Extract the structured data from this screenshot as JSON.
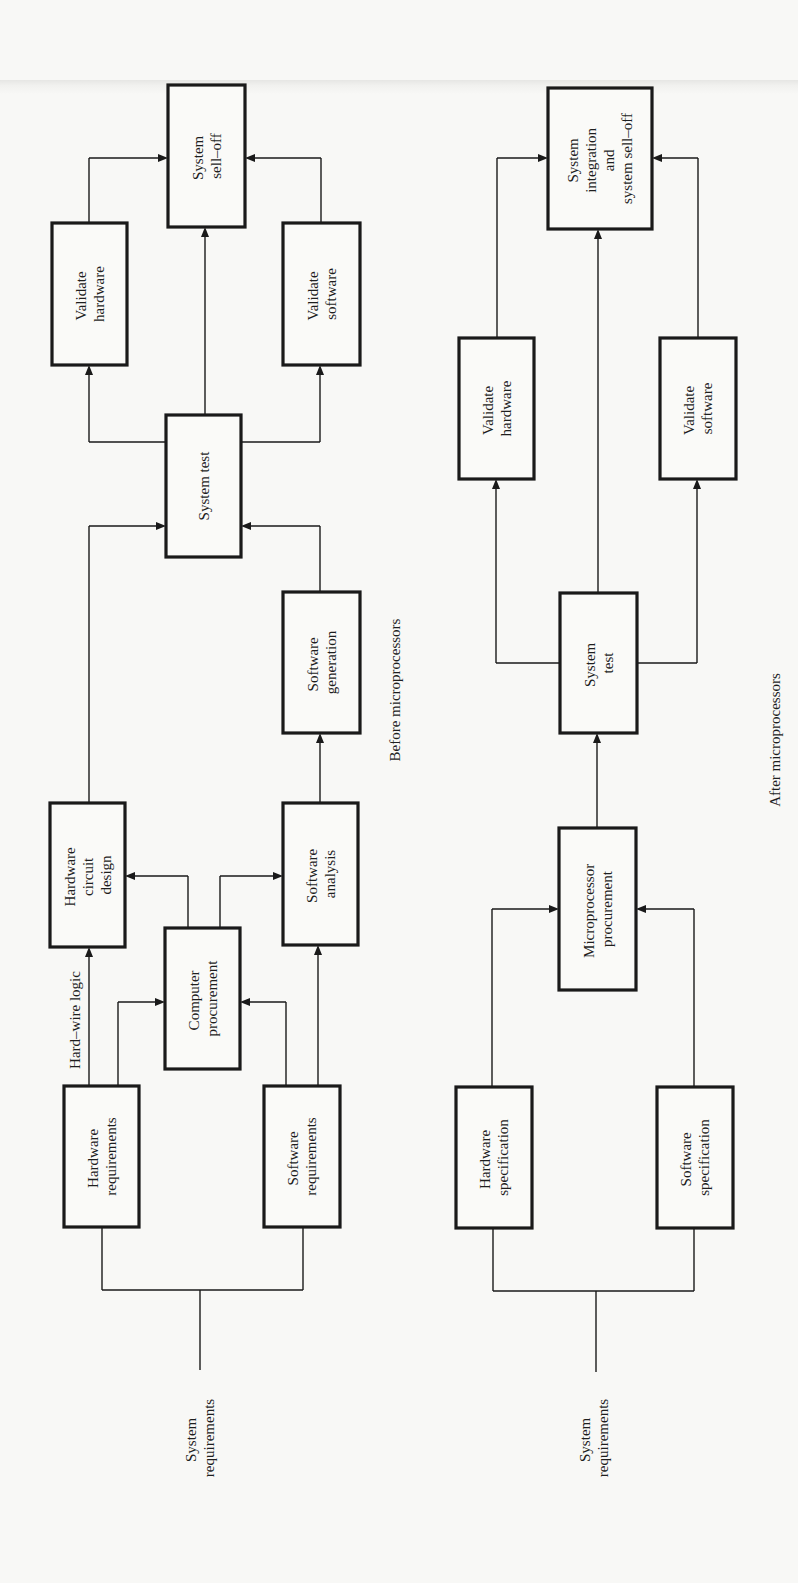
{
  "before": {
    "caption": "Before microprocessors",
    "input_label": [
      "System",
      "requirements"
    ],
    "edge_label": "Hard–wire logic",
    "boxes": {
      "hardware_requirements": [
        "Hardware",
        "requirements"
      ],
      "software_requirements": [
        "Software",
        "requirements"
      ],
      "computer_procurement": [
        "Computer",
        "procurement"
      ],
      "hardware_circuit_design": [
        "Hardware",
        "circuit",
        "design"
      ],
      "software_analysis": [
        "Software",
        "analysis"
      ],
      "software_generation": [
        "Software",
        "generation"
      ],
      "system_test": [
        "System test"
      ],
      "validate_hardware": [
        "Validate",
        "hardware"
      ],
      "validate_software": [
        "Validate",
        "software"
      ],
      "system_sell_off": [
        "System",
        "sell–off"
      ]
    }
  },
  "after": {
    "caption": "After microprocessors",
    "input_label": [
      "System",
      "requirements"
    ],
    "boxes": {
      "hardware_specification": [
        "Hardware",
        "specification"
      ],
      "software_specification": [
        "Software",
        "specification"
      ],
      "microprocessor_procurement": [
        "Microprocessor",
        "procurement"
      ],
      "system_test": [
        "System",
        "test"
      ],
      "validate_hardware": [
        "Validate",
        "hardware"
      ],
      "validate_software": [
        "Validate",
        "software"
      ],
      "system_integration": [
        "System",
        "integration",
        "and",
        "system sell–off"
      ]
    }
  },
  "colors": {
    "ink": "#1a1a1a",
    "paper": "#f8f8f6"
  }
}
